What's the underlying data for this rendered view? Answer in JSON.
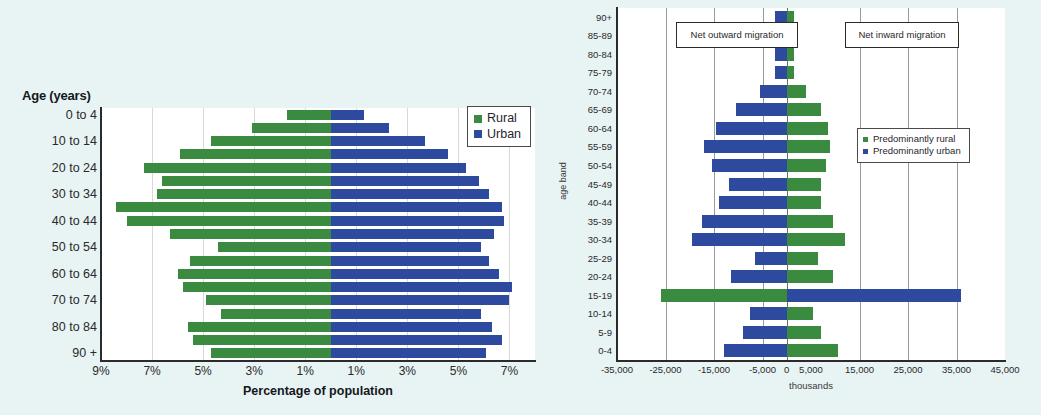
{
  "left": {
    "title": "Age (years)",
    "xlabel": "Percentage of population",
    "xticks": [
      "9%",
      "7%",
      "5%",
      "3%",
      "1%",
      "1%",
      "3%",
      "5%",
      "7%"
    ],
    "ylabels": [
      "90 +",
      "80 to 84",
      "70 to 74",
      "60 to 64",
      "50 to 54",
      "40 to 44",
      "30 to 34",
      "20 to 24",
      "10 to 14",
      "0 to 4"
    ],
    "legend": [
      {
        "label": "Rural",
        "color": "#3a8a3f"
      },
      {
        "label": "Urban",
        "color": "#2d4a9e"
      }
    ]
  },
  "right": {
    "xlabel": "thousands",
    "ylabel": "age band",
    "xticks": [
      "-35,000",
      "-25,000",
      "-15,000",
      "-5,000",
      "0",
      "5,000",
      "15,000",
      "25,000",
      "35,000",
      "45,000"
    ],
    "callout_outward": "Net outward migration",
    "callout_inward": "Net inward migration",
    "legend": [
      {
        "label": "Predominantly rural",
        "color": "#3a8a3f"
      },
      {
        "label": "Predominantly urban",
        "color": "#2d4a9e"
      }
    ]
  },
  "chart_data": [
    {
      "type": "bar",
      "orientation": "horizontal",
      "layout": "population-pyramid",
      "title": "Age (years)",
      "xlabel": "Percentage of population",
      "ylabel": "Age (years)",
      "xlim": [
        -9,
        8
      ],
      "xticks": [
        -9,
        -7,
        -5,
        -3,
        -1,
        1,
        3,
        5,
        7
      ],
      "xticklabels": [
        "9%",
        "7%",
        "5%",
        "3%",
        "1%",
        "1%",
        "3%",
        "5%",
        "7%"
      ],
      "grid": true,
      "legend_position": "top-right",
      "categories": [
        "0 to 4",
        "5 to 9",
        "10 to 14",
        "15 to 19",
        "20 to 24",
        "25 to 29",
        "30 to 34",
        "35 to 39",
        "40 to 44",
        "45 to 49",
        "50 to 54",
        "55 to 59",
        "60 to 64",
        "65 to 69",
        "70 to 74",
        "75 to 79",
        "80 to 84",
        "85 to 89",
        "90 +"
      ],
      "series": [
        {
          "name": "Rural",
          "color": "#3a8a3f",
          "side": "left",
          "values": [
            4.7,
            5.4,
            5.6,
            4.3,
            4.9,
            5.8,
            6.0,
            5.5,
            4.4,
            6.3,
            8.0,
            8.4,
            6.8,
            6.6,
            7.3,
            5.9,
            4.7,
            3.1,
            1.7
          ]
        },
        {
          "name": "Urban",
          "color": "#2d4a9e",
          "side": "right",
          "values": [
            6.1,
            6.7,
            6.3,
            5.9,
            7.0,
            7.1,
            6.6,
            6.2,
            5.9,
            6.4,
            6.8,
            6.7,
            6.2,
            5.8,
            5.3,
            4.6,
            3.7,
            2.3,
            1.3
          ]
        }
      ]
    },
    {
      "type": "bar",
      "orientation": "horizontal",
      "layout": "diverging",
      "title": "",
      "xlabel": "thousands",
      "ylabel": "age band",
      "xlim": [
        -35000,
        45000
      ],
      "xticks": [
        -35000,
        -25000,
        -15000,
        -5000,
        0,
        5000,
        15000,
        25000,
        35000,
        45000
      ],
      "xticklabels": [
        "-35,000",
        "-25,000",
        "-15,000",
        "-5,000",
        "0",
        "5,000",
        "15,000",
        "25,000",
        "35,000",
        "45,000"
      ],
      "grid": true,
      "legend_position": "right",
      "annotations": [
        "Net outward migration",
        "Net inward migration"
      ],
      "categories": [
        "0-4",
        "5-9",
        "10-14",
        "15-19",
        "20-24",
        "25-29",
        "30-34",
        "35-39",
        "40-44",
        "45-49",
        "50-54",
        "55-59",
        "60-64",
        "65-69",
        "70-74",
        "75-79",
        "80-84",
        "85-89",
        "90+"
      ],
      "series": [
        {
          "name": "Predominantly urban",
          "color": "#2d4a9e",
          "values": [
            -13000,
            -9000,
            -7500,
            36000,
            -11500,
            -6500,
            -19500,
            -17500,
            -14000,
            -12000,
            -15500,
            -17000,
            -14500,
            -10500,
            -5500,
            -2500,
            -2500,
            -2500,
            -2500
          ]
        },
        {
          "name": "Predominantly rural",
          "color": "#3a8a3f",
          "values": [
            10500,
            7000,
            5500,
            -26000,
            9500,
            6500,
            12000,
            9500,
            7000,
            7000,
            8000,
            9000,
            8500,
            7000,
            4000,
            1500,
            1500,
            1500,
            1500
          ]
        }
      ]
    }
  ]
}
